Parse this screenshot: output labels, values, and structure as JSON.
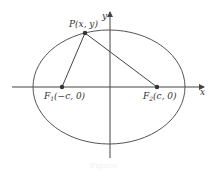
{
  "diagram": {
    "type": "ellipse-with-foci",
    "colors": {
      "stroke": "#444444",
      "text": "#333333",
      "background": "#ffffff"
    },
    "axes": {
      "x_label": "x",
      "y_label": "y"
    },
    "ellipse": {
      "cx": 109,
      "cy": 87,
      "rx": 76,
      "ry": 57
    },
    "points": {
      "P": {
        "label": "P(x, y)",
        "px": 85,
        "py": 33
      },
      "F1": {
        "label_main": "F",
        "label_sub": "1",
        "label_rest": "(−c, 0)",
        "px": 62,
        "py": 87
      },
      "F2": {
        "label_main": "F",
        "label_sub": "2",
        "label_rest": "(c, 0)",
        "px": 157,
        "py": 87
      }
    },
    "caption": "Figure"
  }
}
